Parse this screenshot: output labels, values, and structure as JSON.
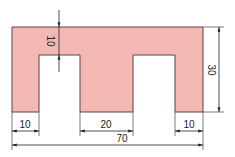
{
  "diagram": {
    "type": "technical-drawing",
    "shape_fill": "#f4b8b4",
    "shape_stroke": "#5a4040",
    "line_color": "#333333",
    "dimensions": {
      "slot_depth": "10",
      "height": "30",
      "left_tooth": "10",
      "middle_gap": "20",
      "right_tooth": "10",
      "overall_width": "70"
    }
  }
}
